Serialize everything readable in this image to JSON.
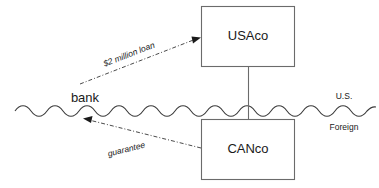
{
  "diagram": {
    "nodes": {
      "usaco": {
        "label": "USAco"
      },
      "canco": {
        "label": "CANco"
      },
      "bank": {
        "label": "bank"
      }
    },
    "regions": {
      "upper": {
        "label": "U.S."
      },
      "lower": {
        "label": "Foreign"
      }
    },
    "flows": {
      "loan": {
        "label": "$2 million loan"
      },
      "guarantee": {
        "label": "guarantee"
      }
    },
    "colors": {
      "box_stroke": "#6b6b6b",
      "border_line": "#3a3a3a",
      "flow_line": "#4a4a4a",
      "text": "#1a1a1a",
      "background": "#ffffff"
    }
  }
}
